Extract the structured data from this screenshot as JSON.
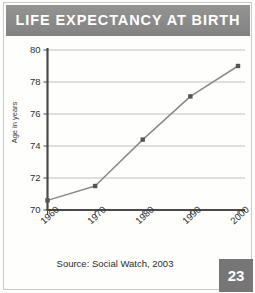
{
  "header": {
    "title": "LIFE EXPECTANCY AT BIRTH",
    "banner_color": "#8d8d8d",
    "title_color": "#ffffff"
  },
  "footer": {
    "source": "Source: Social Watch, 2003",
    "page_number": "23",
    "page_box_color": "#767676"
  },
  "chart_data": {
    "type": "line",
    "title": "LIFE EXPECTANCY AT BIRTH",
    "xlabel": "",
    "ylabel": "Age in years",
    "x": [
      1960,
      1970,
      1980,
      1990,
      2000
    ],
    "categories": [
      "1960",
      "1970",
      "1980",
      "1990",
      "2000"
    ],
    "values": [
      70.6,
      71.5,
      74.4,
      77.1,
      79.0
    ],
    "series": [
      {
        "name": "Life expectancy at birth",
        "values": [
          70.6,
          71.5,
          74.4,
          77.1,
          79.0
        ]
      }
    ],
    "xlim": [
      1960,
      2000
    ],
    "ylim": [
      70,
      80
    ],
    "ytick_labels": [
      "80",
      "78",
      "76",
      "74",
      "72",
      "70"
    ],
    "ytick_values": [
      80,
      78,
      76,
      74,
      72,
      70
    ],
    "xtick_labels": [
      "1960",
      "1970",
      "1980",
      "1990",
      "2000"
    ],
    "grid": "horizontal",
    "legend": "none",
    "line_color": "#8a8a8a",
    "marker_color": "#555555",
    "axis_color": "#4a4a4a",
    "grid_color": "#b9b9b9",
    "source": "Source: Social Watch, 2003"
  }
}
